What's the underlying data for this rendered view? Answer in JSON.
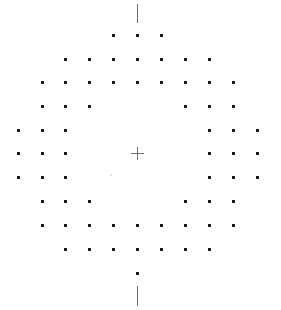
{
  "figure": {
    "type": "visual-field-test-grid",
    "width": 281,
    "height": 310,
    "colors": {
      "background": "#ffffff",
      "dot": "#1a1a1a",
      "line": "#6e6e6e",
      "fixation": "#6e6e6e",
      "artifact": "#e4e4e4"
    },
    "grid": {
      "col_x": [
        18,
        42,
        65,
        89,
        113,
        137,
        161,
        185,
        209,
        233,
        257
      ],
      "row_y": [
        35,
        59,
        82,
        106,
        130,
        153,
        177,
        201,
        225,
        249,
        273
      ],
      "dot_size": 3,
      "rows": [
        {
          "row": 0,
          "cols": [
            4,
            5,
            6
          ]
        },
        {
          "row": 1,
          "cols": [
            2,
            3,
            4,
            5,
            6,
            7,
            8
          ]
        },
        {
          "row": 2,
          "cols": [
            1,
            2,
            3,
            4,
            5,
            6,
            7,
            8,
            9
          ]
        },
        {
          "row": 3,
          "cols": [
            1,
            2,
            3,
            7,
            8,
            9
          ]
        },
        {
          "row": 4,
          "cols": [
            0,
            1,
            2,
            8,
            9,
            10
          ]
        },
        {
          "row": 5,
          "cols": [
            0,
            1,
            2,
            8,
            9,
            10
          ]
        },
        {
          "row": 6,
          "cols": [
            0,
            1,
            2,
            8,
            9,
            10
          ]
        },
        {
          "row": 7,
          "cols": [
            1,
            2,
            3,
            7,
            8,
            9
          ]
        },
        {
          "row": 8,
          "cols": [
            1,
            2,
            3,
            4,
            5,
            6,
            7,
            8,
            9
          ]
        },
        {
          "row": 9,
          "cols": [
            2,
            3,
            4,
            5,
            6,
            7,
            8
          ]
        },
        {
          "row": 10,
          "cols": [
            5
          ]
        }
      ]
    },
    "top_line": {
      "x": 137,
      "y1": 4,
      "y2": 23
    },
    "bottom_line": {
      "x": 137,
      "y1": 286,
      "y2": 306
    },
    "fixation_cross": {
      "x": 137,
      "y": 153,
      "half_size": 6
    },
    "artifact": {
      "x": 110,
      "y": 174
    }
  }
}
